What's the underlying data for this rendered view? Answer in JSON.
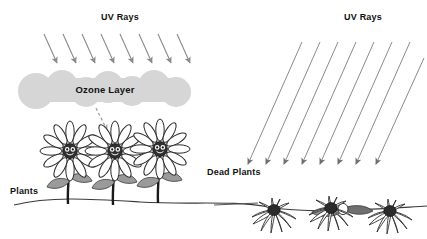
{
  "diagram": {
    "title_left": "UV Rays",
    "title_right": "UV Rays",
    "ozone_label": "Ozone Layer",
    "plants_label": "Plants",
    "dead_plants_label": "Dead Plants",
    "colors": {
      "background": "#ffffff",
      "text": "#111111",
      "ray": "#8a8a8a",
      "ozone_fill": "#d4d4d4",
      "ground": "#3a3a3a",
      "stem": "#1a1a1a",
      "leaf": "#9a9a9a",
      "flower_center": "#2a2a2a",
      "petal_outline": "#2a2a2a",
      "dead_petal": "#3a3a3a"
    }
  },
  "left_scene": {
    "name": "protected-scene",
    "ray_count": 8,
    "rays_blocked": true,
    "flower_count": 3,
    "flower_state": "healthy",
    "has_dashed_arrow": true
  },
  "right_scene": {
    "name": "unprotected-scene",
    "ray_count": 8,
    "rays_blocked": false,
    "flower_count": 3,
    "flower_state": "dead"
  }
}
